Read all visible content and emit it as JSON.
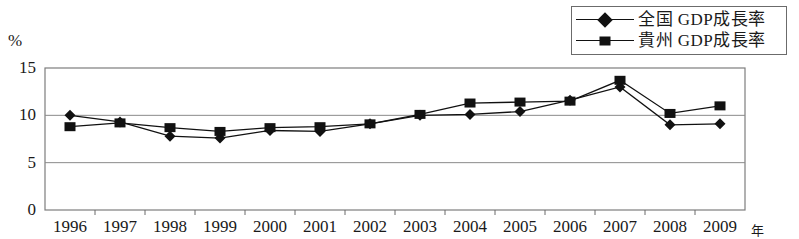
{
  "chart_data": {
    "type": "line",
    "title": "",
    "xlabel": "年",
    "ylabel": "%",
    "categories": [
      "1996",
      "1997",
      "1998",
      "1999",
      "2000",
      "2001",
      "2002",
      "2003",
      "2004",
      "2005",
      "2006",
      "2007",
      "2008",
      "2009"
    ],
    "ylim": [
      0,
      15
    ],
    "yticks": [
      0,
      5,
      10,
      15
    ],
    "ytick_labels": [
      "0",
      "5",
      "10",
      "15"
    ],
    "grid": "horizontal",
    "legend_position": "top-right",
    "series": [
      {
        "name": "全国 GDP成長率",
        "marker": "diamond",
        "color": "#111111",
        "values": [
          10.0,
          9.3,
          7.8,
          7.6,
          8.4,
          8.3,
          9.1,
          10.0,
          10.1,
          10.4,
          11.6,
          13.0,
          9.0,
          9.1
        ]
      },
      {
        "name": "貴州 GDP成長率",
        "marker": "square",
        "color": "#111111",
        "values": [
          8.8,
          9.2,
          8.7,
          8.3,
          8.7,
          8.8,
          9.1,
          10.1,
          11.3,
          11.4,
          11.5,
          13.7,
          10.2,
          11.0
        ]
      }
    ]
  },
  "legend": {
    "items": [
      {
        "label": "全国 GDP成長率",
        "marker": "diamond"
      },
      {
        "label": "貴州 GDP成長率",
        "marker": "square"
      }
    ]
  }
}
